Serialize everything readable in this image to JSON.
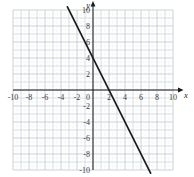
{
  "labels": {
    "x_axis": "x",
    "y_axis": "y",
    "origin": "0"
  },
  "chart_data": {
    "type": "line",
    "title": "",
    "xlabel": "x",
    "ylabel": "y",
    "xlim": [
      -10,
      10
    ],
    "ylim": [
      -10,
      10
    ],
    "grid": "on",
    "grid_major_step": 1,
    "grid_minor_step": 0.5,
    "x_tick_labels": [
      -10,
      -8,
      -6,
      -4,
      -2,
      2,
      4,
      6,
      8,
      10
    ],
    "y_tick_labels": [
      10,
      8,
      6,
      4,
      2,
      -2,
      -4,
      -6,
      -8,
      -10
    ],
    "series": [
      {
        "name": "plotted-line",
        "equation": "y = -2x + 4",
        "slope": -2,
        "y_intercept": 4,
        "x_intercept": 2,
        "endpoints": [
          [
            -3.2,
            10.4
          ],
          [
            7.2,
            -10.4
          ]
        ],
        "sample_points": [
          [
            -3,
            10
          ],
          [
            -2,
            8
          ],
          [
            -1,
            6
          ],
          [
            0,
            4
          ],
          [
            1,
            2
          ],
          [
            2,
            0
          ],
          [
            3,
            -2
          ],
          [
            4,
            -4
          ],
          [
            5,
            -6
          ],
          [
            6,
            -8
          ],
          [
            7,
            -10
          ]
        ]
      }
    ],
    "colors": {
      "background": "#ffffff",
      "axis": "#1a1a1a",
      "line": "#1a1a1a",
      "grid_even": "#b3bdc2",
      "grid_odd": "#c5cdd1",
      "grid_minor": "#dde3e6",
      "label": "#3b3b3b"
    }
  }
}
